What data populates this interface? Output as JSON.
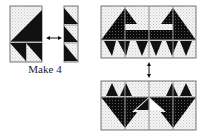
{
  "diagram": {
    "label_make": "Make 4",
    "colors": {
      "dark": "#111111",
      "light_print": "#e8e8e8",
      "seam": "#9a9a9a",
      "outline": "#555555"
    },
    "units": [
      {
        "id": "unit-large",
        "description": "Large half-square triangle over two small half-square triangles"
      },
      {
        "id": "unit-strip",
        "description": "Vertical strip of three half-square triangles"
      },
      {
        "id": "block-top",
        "description": "Joined top half of block (2x2 units)"
      },
      {
        "id": "block-bottom",
        "description": "Joined bottom half of block (rotated)"
      }
    ],
    "arrows": [
      {
        "id": "arrow-horizontal",
        "direction": "left-right"
      },
      {
        "id": "arrow-vertical",
        "direction": "up-down"
      }
    ]
  }
}
